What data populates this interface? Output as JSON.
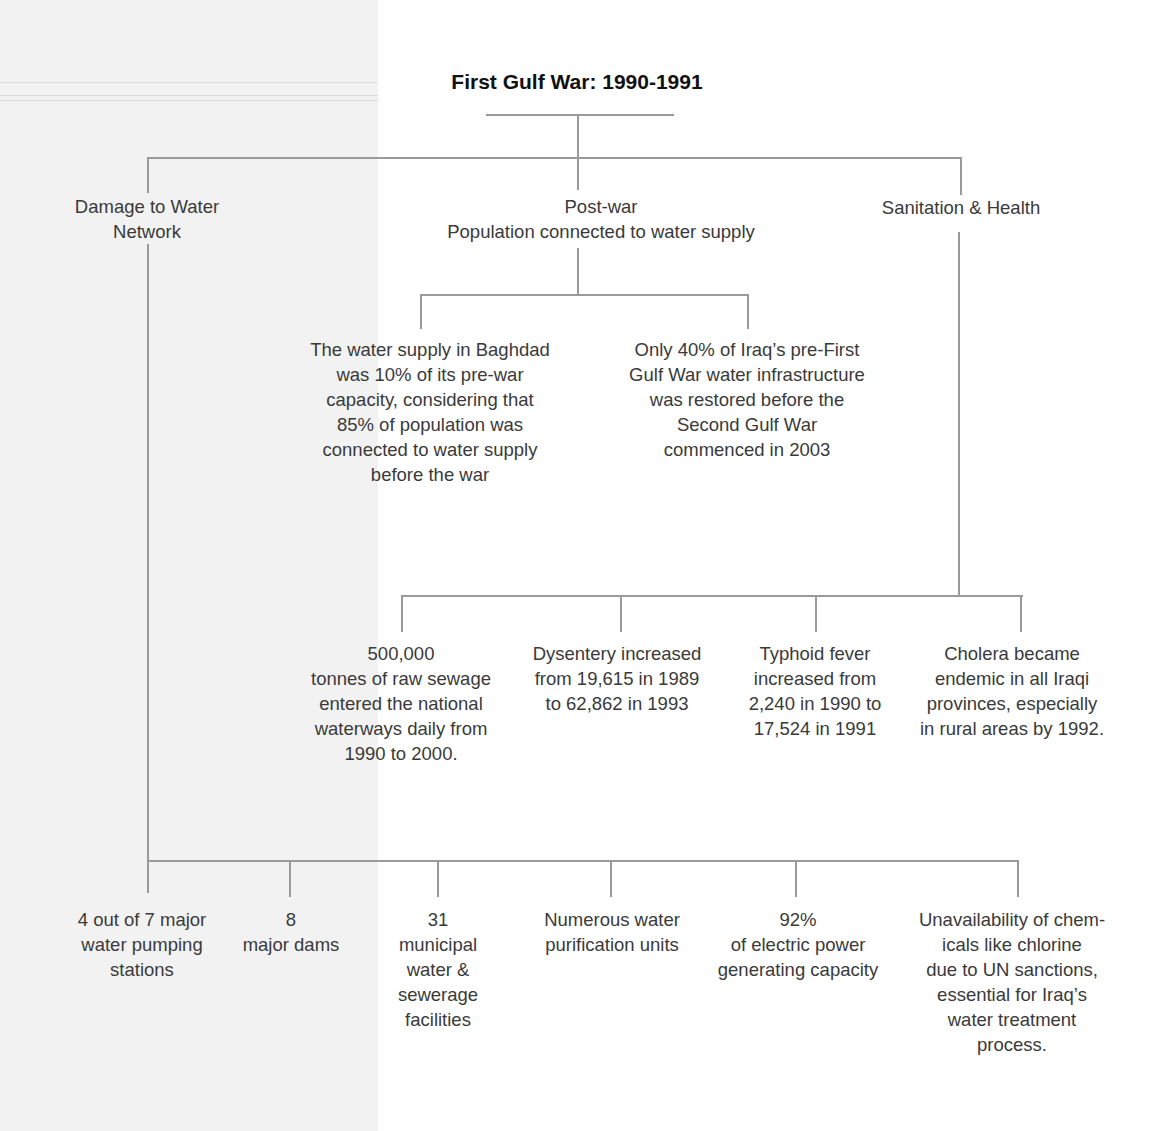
{
  "title": "First Gulf War: 1990-1991",
  "branches": {
    "damage": {
      "label": "Damage to Water\nNetwork"
    },
    "postwar": {
      "label": "Post-war\nPopulation connected to water supply"
    },
    "sanitation": {
      "label": "Sanitation & Health"
    }
  },
  "postwar_items": [
    "The water supply in Baghdad\nwas 10% of its pre-war\ncapacity, considering that\n85% of population was\nconnected to water supply\nbefore the war",
    "Only 40% of Iraq’s pre-First\nGulf War water infrastructure\nwas restored before the\nSecond Gulf War\ncommenced in 2003"
  ],
  "sanitation_items": [
    "500,000\ntonnes of raw sewage\nentered the national\nwaterways daily from\n1990 to 2000.",
    "Dysentery increased\nfrom 19,615 in 1989\nto 62,862 in 1993",
    "Typhoid fever\nincreased from\n2,240 in 1990 to\n17,524 in 1991",
    "Cholera became\nendemic in all Iraqi\nprovinces, especially\nin rural areas by 1992."
  ],
  "damage_items": [
    "4 out of 7 major\nwater pumping\nstations",
    "8\nmajor dams",
    "31\nmunicipal\nwater &\nsewerage\nfacilities",
    "Numerous water\npurification units",
    "92%\nof electric power\ngenerating capacity",
    "Unavailability of chem-\nicals like chlorine\ndue to UN sanctions,\nessential for Iraq’s\nwater treatment\nprocess."
  ],
  "colors": {
    "line": "#9a9a9a",
    "text": "#3a3a3a",
    "title": "#111111",
    "paper_tint": "#f2f2f2"
  }
}
